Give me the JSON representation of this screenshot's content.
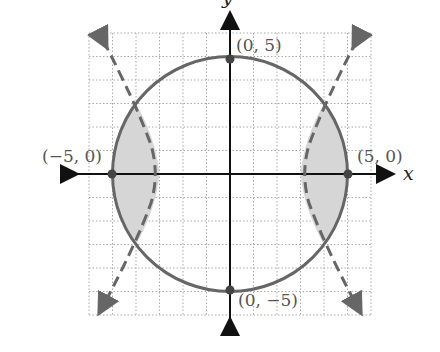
{
  "figure": {
    "axis_labels": {
      "x": "x",
      "y": "y"
    },
    "points": [
      {
        "label": "(0, 5)",
        "x": 0,
        "y": 5
      },
      {
        "label": "(−5, 0)",
        "x": -5,
        "y": 0
      },
      {
        "label": "(5, 0)",
        "x": 5,
        "y": 0
      },
      {
        "label": "(0, −5)",
        "x": 0,
        "y": -5
      }
    ],
    "curves": [
      {
        "name": "circle",
        "style": "solid",
        "radius": 5
      },
      {
        "name": "hyperbola",
        "style": "dashed",
        "vertices": [
          -3,
          3
        ]
      }
    ],
    "shaded_regions": [
      "left lens between circle and hyperbola",
      "right lens between circle and hyperbola"
    ],
    "grid": {
      "xmin": -6,
      "xmax": 6,
      "ymin": -6,
      "ymax": 6
    }
  }
}
